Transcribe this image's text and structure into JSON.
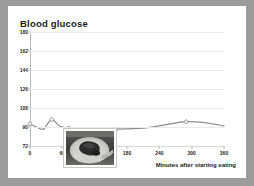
{
  "card": {
    "background": "#ffffff",
    "frame_color": "#9b9b9b"
  },
  "chart_data": {
    "type": "line",
    "title": "Blood glucose",
    "xlabel": "Minutes after starting eating",
    "ylabel": "",
    "xlim": [
      0,
      360
    ],
    "ylim": [
      72,
      180
    ],
    "grid": true,
    "legend": "none",
    "line_color": "#8d8d8d",
    "marker": "open-circle",
    "xticks": [
      0,
      60,
      120,
      180,
      240,
      300,
      360
    ],
    "yticks": [
      72,
      90,
      108,
      126,
      144,
      162,
      180
    ],
    "x": [
      0,
      12,
      25,
      40,
      55,
      72,
      115,
      160,
      210,
      250,
      290,
      325,
      360
    ],
    "values": [
      93,
      90,
      88,
      97,
      91,
      89,
      88,
      88,
      89,
      92,
      95,
      94,
      91
    ],
    "marker_points": [
      {
        "x": 0,
        "y": 93
      },
      {
        "x": 40,
        "y": 97
      },
      {
        "x": 72,
        "y": 89
      },
      {
        "x": 160,
        "y": 88
      },
      {
        "x": 290,
        "y": 95
      }
    ],
    "annotations": [
      {
        "name": "food-photo",
        "kind": "image",
        "description": "grayscale photo of a plate of food"
      }
    ]
  }
}
